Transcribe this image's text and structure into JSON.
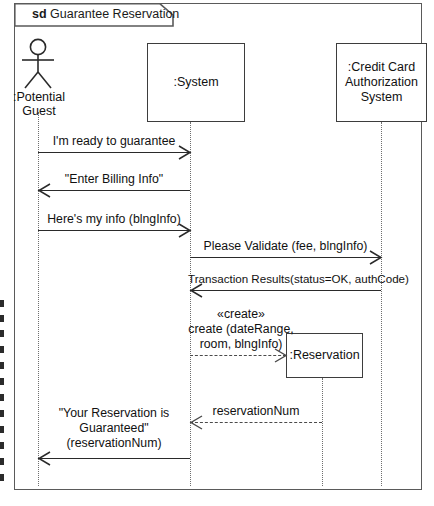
{
  "diagram": {
    "kind_keyword": "sd",
    "title": "Guarantee Reservation",
    "frame_label_full": "sd Guarantee Reservation"
  },
  "participants": [
    {
      "id": "potential-guest",
      "type": "actor",
      "label_line1": ":Potential",
      "label_line2": "Guest",
      "lifeline_x": 38
    },
    {
      "id": "system",
      "type": "object",
      "label": ":System",
      "lifeline_x": 190
    },
    {
      "id": "credit-card-authorization-system",
      "type": "object",
      "label_line1": ":Credit Card",
      "label_line2": "Authorization",
      "label_line3": "System",
      "lifeline_x": 381
    },
    {
      "id": "reservation",
      "type": "object",
      "label": ":Reservation",
      "lifeline_x": 322
    }
  ],
  "messages": [
    {
      "id": "m1",
      "label": "I'm ready to guarantee",
      "from": "potential-guest",
      "to": "system",
      "direction": "right",
      "style": "solid"
    },
    {
      "id": "m2",
      "label": "\"Enter Billing Info\"",
      "from": "system",
      "to": "potential-guest",
      "direction": "left",
      "style": "solid"
    },
    {
      "id": "m3",
      "label": "Here's my info (blngInfo)",
      "from": "potential-guest",
      "to": "system",
      "direction": "right",
      "style": "solid"
    },
    {
      "id": "m4",
      "label": "Please Validate (fee, blngInfo)",
      "from": "system",
      "to": "credit-card-authorization-system",
      "direction": "right",
      "style": "solid"
    },
    {
      "id": "m5",
      "label": "Transaction Results(status=OK, authCode)",
      "from": "credit-card-authorization-system",
      "to": "system",
      "direction": "left",
      "style": "solid"
    },
    {
      "id": "m6",
      "stereotype": "«create»",
      "label_line1": "create (dateRange,",
      "label_line2": "room, blngInfo)",
      "from": "system",
      "to": "reservation",
      "direction": "right",
      "style": "dashed"
    },
    {
      "id": "m7",
      "label": "reservationNum",
      "from": "reservation",
      "to": "system",
      "direction": "left",
      "style": "dashed"
    },
    {
      "id": "m8",
      "label_line1": "\"Your Reservation is",
      "label_line2": "Guaranteed\"",
      "label_line3": "(reservationNum)",
      "from": "system",
      "to": "potential-guest",
      "direction": "left",
      "style": "solid"
    }
  ],
  "colors": {
    "frame_stroke": "#5a5a5a",
    "box_stroke": "#3d3d3d",
    "line": "#2a2a2a",
    "lifeline": "#6e6e6e",
    "text": "#111111",
    "background": "#ffffff"
  }
}
